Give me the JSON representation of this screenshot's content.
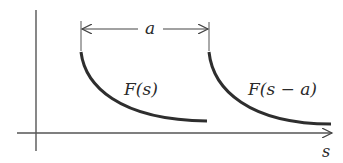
{
  "diagram": {
    "axis": {
      "x_label": "s"
    },
    "shift": {
      "label": "a"
    },
    "curves": [
      {
        "label": "F(s)"
      },
      {
        "label": "F(s − a)"
      }
    ],
    "colors": {
      "stroke": "#2e2e2e",
      "axis": "#555555"
    }
  }
}
